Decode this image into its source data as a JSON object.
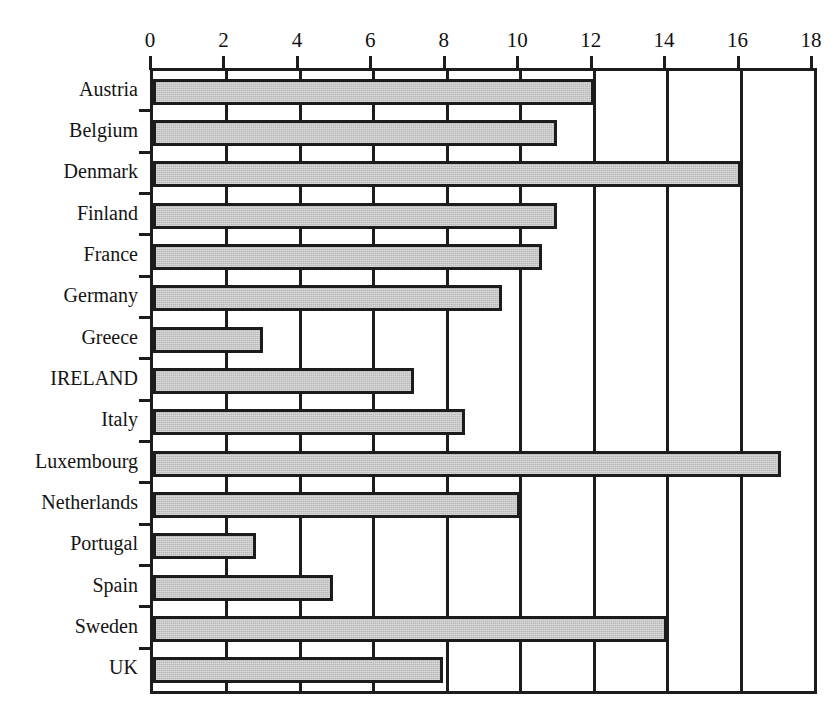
{
  "chart_data": {
    "type": "bar",
    "orientation": "horizontal",
    "title": "",
    "xlabel": "",
    "ylabel": "",
    "xlim": [
      0,
      18
    ],
    "xticks": [
      0,
      2,
      4,
      6,
      8,
      10,
      12,
      14,
      16,
      18
    ],
    "grid": true,
    "grid_axis": "x",
    "legend": false,
    "bar_color": "#b9b9b9",
    "bar_edge_color": "#1c1c1c",
    "axis_color": "#1c1c1c",
    "categories": [
      "Austria",
      "Belgium",
      "Denmark",
      "Finland",
      "France",
      "Germany",
      "Greece",
      "IRELAND",
      "Italy",
      "Luxembourg",
      "Netherlands",
      "Portugal",
      "Spain",
      "Sweden",
      "UK"
    ],
    "values": [
      12,
      11,
      16,
      11,
      10.6,
      9.5,
      3,
      7.1,
      8.5,
      17.1,
      10,
      2.8,
      4.9,
      14,
      7.9
    ]
  },
  "axis": {
    "tick_labels": [
      "0",
      "2",
      "4",
      "6",
      "8",
      "10",
      "12",
      "14",
      "16",
      "18"
    ]
  },
  "title_remnant": {
    "text": "."
  }
}
